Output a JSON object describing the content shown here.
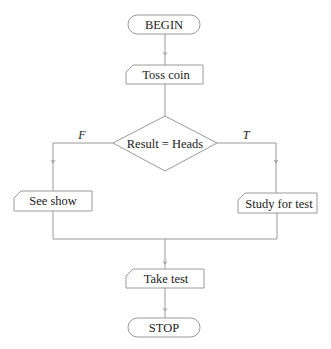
{
  "diagram": {
    "type": "flowchart",
    "nodes": {
      "begin": {
        "label": "BEGIN",
        "shape": "terminator"
      },
      "toss": {
        "label": "Toss coin",
        "shape": "manual-input"
      },
      "decision": {
        "label": "Result = Heads",
        "shape": "decision"
      },
      "see_show": {
        "label": "See show",
        "shape": "manual-input"
      },
      "study": {
        "label": "Study for test",
        "shape": "manual-input"
      },
      "take_test": {
        "label": "Take test",
        "shape": "manual-input"
      },
      "stop": {
        "label": "STOP",
        "shape": "terminator"
      }
    },
    "branches": {
      "false_label": "F",
      "true_label": "T"
    },
    "edges": [
      {
        "from": "begin",
        "to": "toss"
      },
      {
        "from": "toss",
        "to": "decision"
      },
      {
        "from": "decision",
        "to": "see_show",
        "label": "F"
      },
      {
        "from": "decision",
        "to": "study",
        "label": "T"
      },
      {
        "from": "see_show",
        "to": "take_test"
      },
      {
        "from": "study",
        "to": "take_test"
      },
      {
        "from": "take_test",
        "to": "stop"
      }
    ],
    "colors": {
      "stroke": "#9a9a9a",
      "text": "#222222",
      "background": "#ffffff"
    }
  }
}
